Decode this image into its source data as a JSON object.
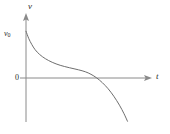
{
  "figure": {
    "background_color": "#ffffff",
    "axis_color": "#8a8a8a",
    "curve_color": "#6e6e6e",
    "text_color": "#2b2b2b"
  },
  "labels": {
    "y_axis": "v",
    "x_axis": "t",
    "origin": "0",
    "initial_value_var": "v",
    "initial_value_sub": "0"
  },
  "chart_data": {
    "type": "line",
    "title": "",
    "xlabel": "t",
    "ylabel": "v",
    "grid": false,
    "legend": null,
    "axis_style": "arrows",
    "xlim": [
      0,
      10
    ],
    "ylim": [
      -4.2,
      3.2
    ],
    "annotations": [
      {
        "text": "v0",
        "x": 0,
        "y": 2.45,
        "note": "initial velocity marked on v-axis"
      },
      {
        "text": "0",
        "x": 0,
        "y": 0,
        "note": "origin label below-left of intersection"
      }
    ],
    "series": [
      {
        "name": "v(t)",
        "x": [
          0.0,
          0.25,
          0.5,
          0.8,
          1.2,
          1.7,
          2.3,
          3.0,
          3.8,
          4.6,
          5.2,
          5.7,
          6.2,
          6.7,
          7.2,
          7.7,
          8.2,
          8.6,
          8.9
        ],
        "values": [
          2.45,
          1.95,
          1.58,
          1.22,
          0.9,
          0.62,
          0.38,
          0.18,
          0.02,
          -0.12,
          -0.25,
          -0.42,
          -0.66,
          -0.98,
          -1.38,
          -1.88,
          -2.48,
          -3.05,
          -3.55
        ]
      }
    ]
  }
}
